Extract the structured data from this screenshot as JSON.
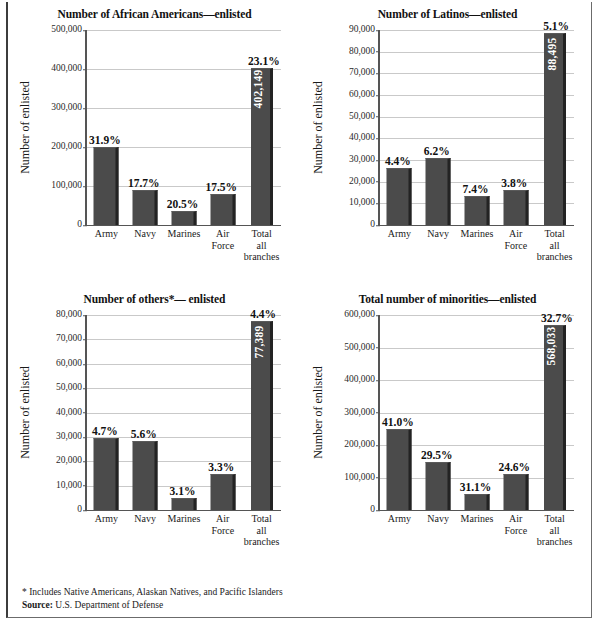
{
  "figure": {
    "footnote": "* Includes Native Americans, Alaskan Natives, and Pacific Islanders",
    "source_label": "Source:",
    "source_text": "U.S. Department of Defense",
    "bar_color": "#4b4b4b",
    "bar_shadow_color": "#232323",
    "grid_color": "#c9c9c9",
    "axis_color": "#555555"
  },
  "chart_data": [
    {
      "type": "bar",
      "title": "Number of African Americans—enlisted",
      "xlabel": "",
      "ylabel": "Number of enlisted",
      "categories": [
        "Army",
        "Navy",
        "Marines",
        "Air Force",
        "Total all branches"
      ],
      "category_lines": [
        [
          "Army"
        ],
        [
          "Navy"
        ],
        [
          "Marines"
        ],
        [
          "Air",
          "Force"
        ],
        [
          "Total",
          "all",
          "branches"
        ]
      ],
      "values": [
        200000,
        90000,
        35000,
        80000,
        402149
      ],
      "data_labels": [
        "31.9%",
        "17.7%",
        "20.5%",
        "17.5%",
        "23.1%"
      ],
      "bar_inner_label": "402,149",
      "ylim": [
        0,
        500000
      ],
      "yticks": [
        0,
        100000,
        200000,
        300000,
        400000,
        500000
      ],
      "ytick_labels": [
        "0",
        "100,000",
        "200,000",
        "300,000",
        "400,000",
        "500,000"
      ],
      "grid": true,
      "legend": "none"
    },
    {
      "type": "bar",
      "title": "Number of Latinos—enlisted",
      "xlabel": "",
      "ylabel": "Number of enlisted",
      "categories": [
        "Army",
        "Navy",
        "Marines",
        "Air Force",
        "Total all branches"
      ],
      "category_lines": [
        [
          "Army"
        ],
        [
          "Navy"
        ],
        [
          "Marines"
        ],
        [
          "Air",
          "Force"
        ],
        [
          "Total",
          "all",
          "branches"
        ]
      ],
      "values": [
        26500,
        31000,
        13500,
        16000,
        88495
      ],
      "data_labels": [
        "4.4%",
        "6.2%",
        "7.4%",
        "3.8%",
        "5.1%"
      ],
      "bar_inner_label": "88,495",
      "ylim": [
        0,
        90000
      ],
      "yticks": [
        0,
        10000,
        20000,
        30000,
        40000,
        50000,
        60000,
        70000,
        80000,
        90000
      ],
      "ytick_labels": [
        "0",
        "10,000",
        "20,000",
        "30,000",
        "40,000",
        "50,000",
        "60,000",
        "70,000",
        "80,000",
        "90,000"
      ],
      "grid": true,
      "legend": "none"
    },
    {
      "type": "bar",
      "title": "Number of others*— enlisted",
      "xlabel": "",
      "ylabel": "Number of enlisted",
      "categories": [
        "Army",
        "Navy",
        "Marines",
        "Air Force",
        "Total all branches"
      ],
      "category_lines": [
        [
          "Army"
        ],
        [
          "Navy"
        ],
        [
          "Marines"
        ],
        [
          "Air",
          "Force"
        ],
        [
          "Total",
          "all",
          "branches"
        ]
      ],
      "values": [
        29500,
        28500,
        5000,
        14800,
        77389
      ],
      "data_labels": [
        "4.7%",
        "5.6%",
        "3.1%",
        "3.3%",
        "4.4%"
      ],
      "bar_inner_label": "77,389",
      "ylim": [
        0,
        80000
      ],
      "yticks": [
        0,
        10000,
        20000,
        30000,
        40000,
        50000,
        60000,
        70000,
        80000
      ],
      "ytick_labels": [
        "0",
        "10,000",
        "20,000",
        "30,000",
        "40,000",
        "50,000",
        "60,000",
        "70,000",
        "80,000"
      ],
      "grid": true,
      "legend": "none"
    },
    {
      "type": "bar",
      "title": "Total number of minorities—enlisted",
      "xlabel": "",
      "ylabel": "Number of enlisted",
      "categories": [
        "Army",
        "Navy",
        "Marines",
        "Air Force",
        "Total all branches"
      ],
      "category_lines": [
        [
          "Army"
        ],
        [
          "Navy"
        ],
        [
          "Marines"
        ],
        [
          "Air",
          "Force"
        ],
        [
          "Total",
          "all",
          "branches"
        ]
      ],
      "values": [
        248000,
        147000,
        50000,
        111000,
        568033
      ],
      "data_labels": [
        "41.0%",
        "29.5%",
        "31.1%",
        "24.6%",
        "32.7%"
      ],
      "bar_inner_label": "568,033",
      "ylim": [
        0,
        600000
      ],
      "yticks": [
        0,
        100000,
        200000,
        300000,
        400000,
        500000,
        600000
      ],
      "ytick_labels": [
        "0",
        "100,000",
        "200,000",
        "300,000",
        "400,000",
        "500,000",
        "600,000"
      ],
      "grid": true,
      "legend": "none"
    }
  ]
}
